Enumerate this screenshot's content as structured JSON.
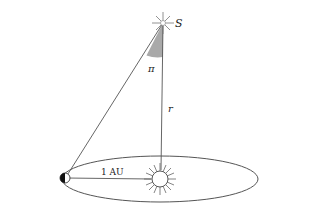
{
  "diagram": {
    "labels": {
      "star": "S",
      "parallax_angle": "π",
      "distance": "r",
      "baseline": "1 AU"
    },
    "objects": {
      "star": {
        "name": "Star S",
        "x": 163,
        "y": 23
      },
      "sun": {
        "name": "Sun",
        "x": 160,
        "y": 179
      },
      "earth": {
        "name": "Earth",
        "x": 65,
        "y": 178
      },
      "orbit": {
        "cx": 160,
        "cy": 179,
        "rx": 98,
        "ry": 23
      }
    },
    "colors": {
      "line": "#444444",
      "angle_fill": "#a9a9a9",
      "earth_dark": "#111111"
    }
  }
}
